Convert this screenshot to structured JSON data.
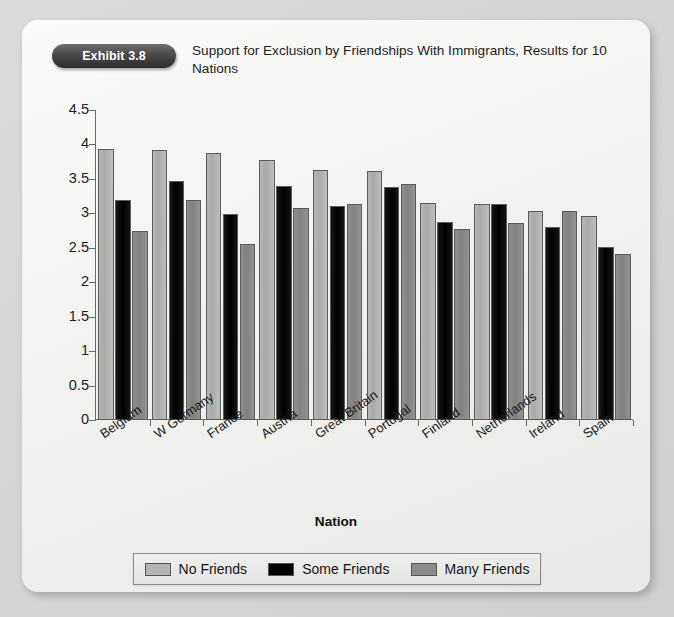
{
  "exhibit": {
    "badge": "Exhibit 3.8",
    "title": "Support for Exclusion by Friendships With Immigrants, Results for 10 Nations"
  },
  "colors": {
    "page_background": "#d8d8d6",
    "card_background": "#f4f4f2",
    "badge_background": "#3a3a3a",
    "series_no_friends": "#b4b4b2",
    "series_some_friends": "#000000",
    "series_many_friends": "#8b8b89",
    "axis": "#6a6a6a"
  },
  "chart_data": {
    "type": "bar",
    "title": "Support for Exclusion by Friendships With Immigrants, Results for 10 Nations",
    "xlabel": "Nation",
    "ylabel": "",
    "ylim": [
      0,
      4.5
    ],
    "ytick_step": 0.5,
    "yticks": [
      "0",
      "0.5",
      "1",
      "1.5",
      "2",
      "2.5",
      "3",
      "3.5",
      "4",
      "4.5"
    ],
    "grid": false,
    "legend_position": "bottom",
    "categories": [
      "Belgium",
      "W Germany",
      "France",
      "Austria",
      "Great Britain",
      "Portugal",
      "Finland",
      "Netherlands",
      "Ireland",
      "Spain"
    ],
    "series": [
      {
        "name": "No Friends",
        "color": "#b4b4b2",
        "values": [
          3.93,
          3.92,
          3.87,
          3.78,
          3.63,
          3.62,
          3.15,
          3.14,
          3.03,
          2.96
        ]
      },
      {
        "name": "Some Friends",
        "color": "#000000",
        "values": [
          3.2,
          3.47,
          2.99,
          3.4,
          3.11,
          3.38,
          2.87,
          3.13,
          2.8,
          2.51
        ]
      },
      {
        "name": "Many Friends",
        "color": "#8b8b89",
        "values": [
          2.74,
          3.19,
          2.56,
          3.08,
          3.14,
          3.42,
          2.78,
          2.86,
          3.03,
          2.41
        ]
      }
    ]
  }
}
